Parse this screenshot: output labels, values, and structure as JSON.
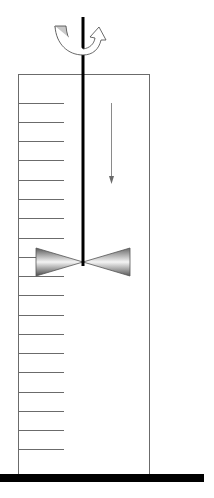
{
  "diagram": {
    "colors": {
      "outline": "#6b6b6b",
      "shaft": "#000000",
      "floor": "#000000",
      "flow_arrow": "#8a8a8a",
      "rotation_arrow_fill": "#c8c8c8"
    },
    "tank": {
      "x": 18,
      "y": 74,
      "width": 131,
      "height": 402
    },
    "level_marks": {
      "count": 19,
      "first_y": 103,
      "spacing": 19.2,
      "length": 46
    },
    "shaft": {
      "x": 83,
      "y1": 17,
      "y2": 266
    },
    "impeller": {
      "center_x": 83,
      "center_y": 262,
      "half_width": 63,
      "half_height": 14
    },
    "flow_arrow": {
      "x": 111,
      "y1": 103,
      "y2": 183,
      "direction": "down"
    },
    "rotation_arrow": {
      "direction": "counterclockwise-about-shaft"
    },
    "floor": {
      "y": 474,
      "height": 8,
      "width": 204
    }
  }
}
